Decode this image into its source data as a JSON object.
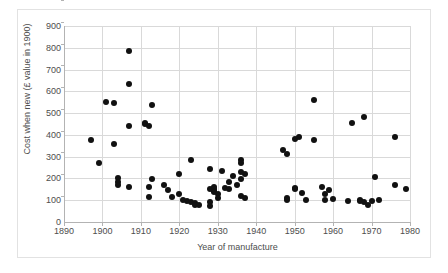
{
  "chart_data": {
    "type": "scatter",
    "title": "",
    "xlabel": "Year of manufacture",
    "ylabel": "Cost when new (£ value in 1900)",
    "xlim": [
      1890,
      1980
    ],
    "ylim": [
      0,
      900
    ],
    "xticks": [
      1890,
      1900,
      1910,
      1920,
      1930,
      1940,
      1950,
      1960,
      1970,
      1980
    ],
    "yticks": [
      0,
      100,
      200,
      300,
      400,
      500,
      600,
      700,
      800,
      900
    ],
    "xtick_labels": [
      "1890",
      "1900",
      "1910",
      "1920",
      "1930",
      "1940",
      "1950",
      "1960",
      "1970",
      "1980"
    ],
    "ytick_labels": [
      "0",
      "100",
      "200",
      "300",
      "400",
      "500",
      "600",
      "700",
      "800",
      "900"
    ],
    "grid": true,
    "legend": false,
    "marker_color": "#111111",
    "gridline_color": "#d9d9d9",
    "axis_color": "#b3b3b3",
    "points": [
      [
        1897,
        375
      ],
      [
        1899,
        270
      ],
      [
        1901,
        550
      ],
      [
        1903,
        545
      ],
      [
        1903,
        358
      ],
      [
        1904,
        200
      ],
      [
        1904,
        185
      ],
      [
        1904,
        172
      ],
      [
        1907,
        783
      ],
      [
        1907,
        635
      ],
      [
        1907,
        440
      ],
      [
        1907,
        163
      ],
      [
        1911,
        455
      ],
      [
        1911,
        448
      ],
      [
        1912,
        440
      ],
      [
        1912,
        163
      ],
      [
        1912,
        113
      ],
      [
        1913,
        535
      ],
      [
        1913,
        197
      ],
      [
        1916,
        170
      ],
      [
        1917,
        148
      ],
      [
        1918,
        113
      ],
      [
        1920,
        222
      ],
      [
        1920,
        130
      ],
      [
        1921,
        100
      ],
      [
        1922,
        96
      ],
      [
        1923,
        285
      ],
      [
        1923,
        92
      ],
      [
        1924,
        88
      ],
      [
        1924,
        78
      ],
      [
        1925,
        80
      ],
      [
        1928,
        245
      ],
      [
        1928,
        150
      ],
      [
        1928,
        90
      ],
      [
        1928,
        72
      ],
      [
        1929,
        160
      ],
      [
        1929,
        150
      ],
      [
        1929,
        143
      ],
      [
        1929,
        138
      ],
      [
        1930,
        128
      ],
      [
        1930,
        108
      ],
      [
        1931,
        232
      ],
      [
        1932,
        155
      ],
      [
        1933,
        185
      ],
      [
        1933,
        150
      ],
      [
        1934,
        210
      ],
      [
        1935,
        170
      ],
      [
        1936,
        285
      ],
      [
        1936,
        270
      ],
      [
        1936,
        228
      ],
      [
        1936,
        196
      ],
      [
        1936,
        118
      ],
      [
        1937,
        222
      ],
      [
        1937,
        110
      ],
      [
        1947,
        330
      ],
      [
        1948,
        313
      ],
      [
        1948,
        108
      ],
      [
        1948,
        100
      ],
      [
        1950,
        380
      ],
      [
        1950,
        155
      ],
      [
        1950,
        150
      ],
      [
        1951,
        392
      ],
      [
        1952,
        132
      ],
      [
        1953,
        100
      ],
      [
        1955,
        560
      ],
      [
        1955,
        378
      ],
      [
        1957,
        163
      ],
      [
        1958,
        128
      ],
      [
        1958,
        100
      ],
      [
        1959,
        148
      ],
      [
        1960,
        105
      ],
      [
        1964,
        95
      ],
      [
        1965,
        455
      ],
      [
        1967,
        100
      ],
      [
        1967,
        98
      ],
      [
        1968,
        480
      ],
      [
        1968,
        93
      ],
      [
        1969,
        80
      ],
      [
        1970,
        98
      ],
      [
        1971,
        205
      ],
      [
        1972,
        100
      ],
      [
        1976,
        168
      ],
      [
        1976,
        390
      ],
      [
        1979,
        150
      ]
    ]
  }
}
